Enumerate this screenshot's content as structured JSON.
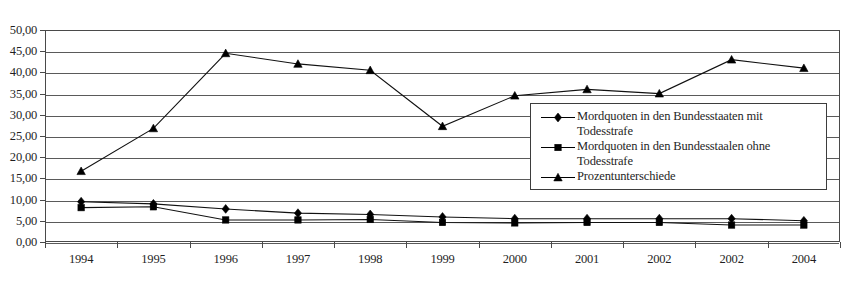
{
  "chart_data": {
    "type": "line",
    "title": "",
    "subtitle": "",
    "xlabel": "",
    "ylabel": "",
    "categories": [
      "1994",
      "1995",
      "1996",
      "1997",
      "1998",
      "1999",
      "2000",
      "2001",
      "2002",
      "2002",
      "2004"
    ],
    "ylim": [
      0,
      50
    ],
    "ytick_step": 5,
    "ytick_labels": [
      "0,00",
      "5,00",
      "10,00",
      "15,00",
      "20,00",
      "25,00",
      "30,00",
      "35,00",
      "40,00",
      "45,00",
      "50,00"
    ],
    "grid": true,
    "legend_position": "center-right",
    "decimal_separator": ",",
    "series": [
      {
        "name": "Mordquoten in den Bundesstaaten mit Todesstrafe",
        "marker": "diamond",
        "color": "#000000",
        "values": [
          9.5,
          9.0,
          7.8,
          6.8,
          6.5,
          5.9,
          5.5,
          5.5,
          5.5,
          5.5,
          5.0
        ]
      },
      {
        "name": "Mordquoten in den Bundesstaalen ohne Todesstrafe",
        "marker": "square",
        "color": "#000000",
        "values": [
          8.1,
          8.3,
          5.2,
          5.2,
          5.3,
          4.6,
          4.5,
          4.6,
          4.6,
          4.0,
          4.0
        ]
      },
      {
        "name": "Prozentunterschiede",
        "marker": "triangle",
        "color": "#000000",
        "values": [
          16.7,
          26.8,
          44.5,
          42.0,
          40.5,
          27.3,
          34.5,
          36.0,
          35.0,
          43.0,
          41.0
        ]
      }
    ]
  },
  "legend": {
    "entries": [
      {
        "label": "Mordquoten in den Bundesstaaten mit Todesstrafe",
        "marker": "diamond-marker-icon"
      },
      {
        "label": "Mordquoten in den Bundesstaalen ohne Todesstrafe",
        "marker": "square-marker-icon"
      },
      {
        "label": "Prozentunterschiede",
        "marker": "triangle-marker-icon"
      }
    ]
  },
  "colors": {
    "axis": "#4a4a4a",
    "grid": "#5a5a5a",
    "series": "#000000",
    "background": "#ffffff",
    "text": "#1f1f1f"
  }
}
